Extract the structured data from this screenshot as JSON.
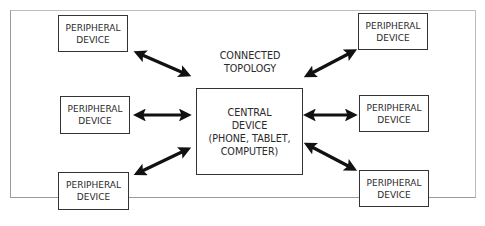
{
  "diagram": {
    "title_lines": [
      "CONNECTED",
      "TOPOLOGY"
    ],
    "central": {
      "lines": [
        "CENTRAL",
        "DEVICE",
        "(PHONE, TABLET,",
        "COMPUTER)"
      ]
    },
    "peripherals": [
      {
        "position": "top-left",
        "lines": [
          "PERIPHERAL",
          "DEVICE"
        ]
      },
      {
        "position": "middle-left",
        "lines": [
          "PERIPHERAL",
          "DEVICE"
        ]
      },
      {
        "position": "bottom-left",
        "lines": [
          "PERIPHERAL",
          "DEVICE"
        ]
      },
      {
        "position": "top-right",
        "lines": [
          "PERIPHERAL",
          "DEVICE"
        ]
      },
      {
        "position": "middle-right",
        "lines": [
          "PERIPHERAL",
          "DEVICE"
        ]
      },
      {
        "position": "bottom-right",
        "lines": [
          "PERIPHERAL",
          "DEVICE"
        ]
      }
    ],
    "connections": [
      {
        "from": "central",
        "to": "top-left",
        "type": "bidirectional"
      },
      {
        "from": "central",
        "to": "middle-left",
        "type": "bidirectional"
      },
      {
        "from": "central",
        "to": "bottom-left",
        "type": "bidirectional"
      },
      {
        "from": "central",
        "to": "top-right",
        "type": "bidirectional"
      },
      {
        "from": "central",
        "to": "middle-right",
        "type": "bidirectional"
      },
      {
        "from": "central",
        "to": "bottom-right",
        "type": "bidirectional"
      }
    ],
    "colors": {
      "stroke": "#111111",
      "text": "#2a2a2a",
      "frame": "#9a9a9a"
    }
  }
}
